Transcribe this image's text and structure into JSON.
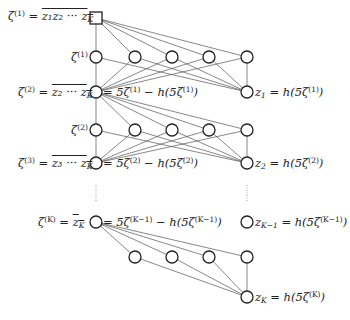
{
  "diagram": {
    "type": "neural-network-construction",
    "labels": {
      "top": {
        "lhs": "ζ",
        "lhs_sup": "(1)",
        "eq": " = ",
        "rhs": "z₁z₂ ··· z",
        "rhs_sub": "K"
      },
      "row1_hidden": {
        "text": "ζ",
        "sup": "(1)"
      },
      "row2_left": {
        "lhs": "ζ",
        "lhs_sup": "(2)",
        "eq": " = ",
        "rhs": "z₂ ··· z",
        "rhs_sub": "K"
      },
      "row2_mid": {
        "a": "= 5ζ",
        "a_sup": "(1)",
        "b": " − h(5ζ",
        "b_sup": "(1)",
        "c": ")"
      },
      "row2_right": {
        "a": "z",
        "a_sub": "1",
        "b": " = h(5ζ",
        "b_sup": "(1)",
        "c": ")"
      },
      "row3_hidden": {
        "text": "ζ",
        "sup": "(2)"
      },
      "row3_left": {
        "lhs": "ζ",
        "lhs_sup": "(3)",
        "eq": " = ",
        "rhs": "z₃ ··· z",
        "rhs_sub": "K"
      },
      "row3_mid": {
        "a": "= 5ζ",
        "a_sup": "(2)",
        "b": " − h(5ζ",
        "b_sup": "(2)",
        "c": ")"
      },
      "row3_right": {
        "a": "z",
        "a_sub": "2",
        "b": " = h(5ζ",
        "b_sup": "(2)",
        "c": ")"
      },
      "rowK_left": {
        "lhs": "ζ",
        "lhs_sup": "(K)",
        "eq": " = ",
        "rhs": "z",
        "rhs_sub": "K"
      },
      "rowK_mid": {
        "a": "= 5ζ",
        "a_sup": "(K−1)",
        "b": " − h(5ζ",
        "b_sup": "(K−1)",
        "c": ")"
      },
      "rowK_right": {
        "a": "z",
        "a_sub": "K−1",
        "b": " = h(5ζ",
        "b_sup": "(K−1)",
        "c": ")"
      },
      "bottom_right": {
        "a": "z",
        "a_sub": "K",
        "b": " = h(5ζ",
        "b_sup": "(K)",
        "c": ")"
      }
    },
    "colors": {
      "stroke": "#222222",
      "edge": "#555555",
      "background": "#ffffff"
    }
  }
}
